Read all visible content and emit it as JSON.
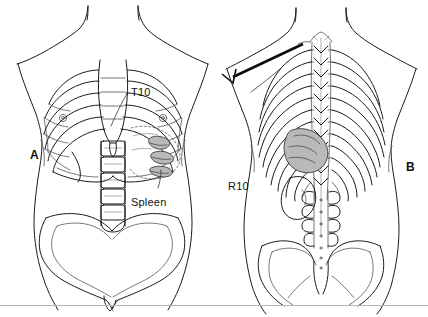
{
  "figure": {
    "width": 428,
    "height": 317,
    "background": "#ffffff",
    "ink_color": "#1b1b1b",
    "shade_color": "#b9b9b9",
    "type": "anatomical-line-drawing",
    "panels": [
      {
        "id": "A",
        "panel_label": "A",
        "view": "anterior torso with rib cage, sternum, lumbar spine and pelvis",
        "label_x": 30,
        "label_y": 148,
        "annotations": [
          {
            "name": "t10-label",
            "text": "T10",
            "x": 131,
            "y": 86,
            "leader": true
          },
          {
            "name": "spleen-label",
            "text": "Spleen",
            "x": 131,
            "y": 196,
            "leader": true
          }
        ]
      },
      {
        "id": "B",
        "panel_label": "B",
        "view": "posterior torso with thoracic spine, rib cage, kidney and pelvis",
        "label_x": 406,
        "label_y": 160,
        "annotations": [
          {
            "name": "r10-label",
            "text": "R10",
            "x": 228,
            "y": 180,
            "leader": true
          }
        ],
        "instrument": {
          "name": "needle",
          "present": true,
          "entry_description": "needle angled beneath the tenth rib"
        }
      }
    ],
    "divider": {
      "name": "bottom-rule",
      "y": 305,
      "color": "#b5b5b5"
    }
  }
}
